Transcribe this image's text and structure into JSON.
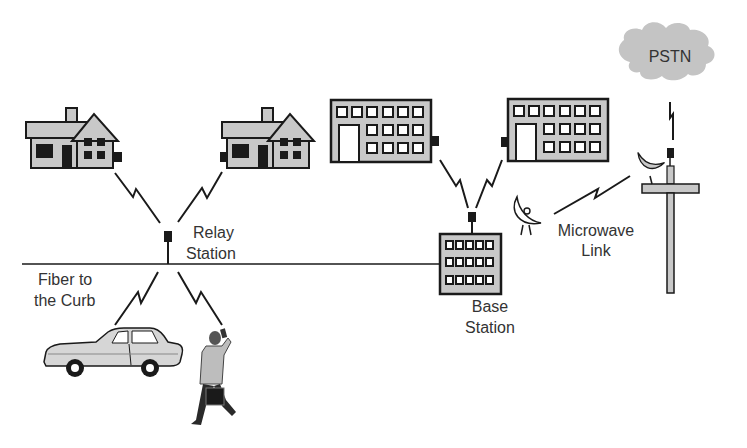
{
  "diagram": {
    "labels": {
      "relay_station_line1": "Relay",
      "relay_station_line2": "Station",
      "fiber_line1": "Fiber to",
      "fiber_line2": "the Curb",
      "base_station_line1": "Base",
      "base_station_line2": "Station",
      "microwave_line1": "Microwave",
      "microwave_line2": "Link",
      "pstn": "PSTN"
    },
    "nodes": [
      {
        "id": "house-left",
        "type": "house",
        "icon": "house-icon"
      },
      {
        "id": "house-right",
        "type": "house",
        "icon": "house-icon"
      },
      {
        "id": "office-left",
        "type": "office-building",
        "icon": "building-icon"
      },
      {
        "id": "office-right",
        "type": "office-building",
        "icon": "building-icon"
      },
      {
        "id": "relay-station",
        "type": "antenna",
        "icon": "antenna-icon"
      },
      {
        "id": "base-station",
        "type": "building",
        "icon": "building-icon"
      },
      {
        "id": "car",
        "type": "vehicle",
        "icon": "car-icon"
      },
      {
        "id": "pedestrian",
        "type": "person",
        "icon": "person-with-phone-icon"
      },
      {
        "id": "microwave-tower",
        "type": "tower",
        "icon": "tower-icon"
      },
      {
        "id": "pstn-cloud",
        "type": "cloud",
        "icon": "cloud-icon"
      }
    ],
    "links": [
      {
        "from": "house-left",
        "to": "relay-station",
        "kind": "wireless"
      },
      {
        "from": "house-right",
        "to": "relay-station",
        "kind": "wireless"
      },
      {
        "from": "relay-station",
        "to": "car",
        "kind": "wireless"
      },
      {
        "from": "relay-station",
        "to": "pedestrian",
        "kind": "wireless"
      },
      {
        "from": "relay-station",
        "to": "base-station",
        "kind": "fiber"
      },
      {
        "from": "office-left",
        "to": "base-station",
        "kind": "wireless"
      },
      {
        "from": "office-right",
        "to": "base-station",
        "kind": "wireless"
      },
      {
        "from": "base-station",
        "to": "microwave-tower",
        "kind": "microwave"
      },
      {
        "from": "microwave-tower",
        "to": "pstn-cloud",
        "kind": "wireless"
      }
    ],
    "colors": {
      "fill_gray": "#c8c8c8",
      "stroke": "#1a1a1a",
      "cloud": "#c4c4c4",
      "text": "#333333"
    }
  }
}
